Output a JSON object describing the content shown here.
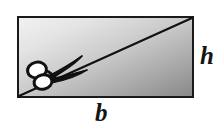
{
  "figure": {
    "kind": "geometry-diagram",
    "background_color": "#ffffff"
  },
  "rectangle": {
    "name": "shaded-rectangle",
    "x": 17,
    "y": 16,
    "width": 177,
    "height": 82,
    "border_color": "#1a1a1a",
    "border_width": 2,
    "fill": {
      "type": "linear-gradient",
      "direction": "top-left-to-bottom-right",
      "start_color": "#f2f2f2",
      "mid_color": "#c9c9c9",
      "end_color": "#878787"
    }
  },
  "diagonal": {
    "name": "diagonal-cut-line",
    "x1": 19,
    "y1": 96,
    "x2": 192,
    "y2": 18,
    "color": "#111111",
    "width": 2
  },
  "scissors": {
    "name": "scissors",
    "color": "#111111",
    "pivot_x": 52,
    "pivot_y": 74,
    "handle_ring_upper": {
      "cx": 37,
      "cy": 70,
      "rx": 9,
      "ry": 7.5
    },
    "handle_ring_lower": {
      "cx": 42,
      "cy": 82,
      "rx": 8.5,
      "ry": 7
    },
    "blade_upper_tip_x": 81,
    "blade_upper_tip_y": 58,
    "blade_lower_tip_x": 86,
    "blade_lower_tip_y": 72
  },
  "labels": {
    "height": {
      "text": "h",
      "name": "height-label",
      "meaning": "height of rectangle",
      "position": "right-outside"
    },
    "base": {
      "text": "b",
      "name": "base-label",
      "meaning": "base of rectangle",
      "position": "bottom-outside"
    }
  }
}
